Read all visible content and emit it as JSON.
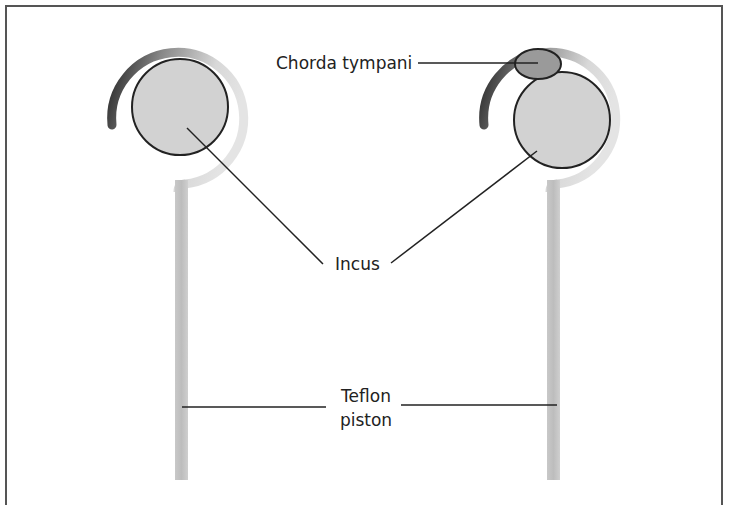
{
  "figure": {
    "labels": {
      "chorda_tympani": "Chorda tympani",
      "incus": "Incus",
      "teflon_line1": "Teflon",
      "teflon_line2": "piston"
    },
    "colors": {
      "frame": "#555555",
      "incus_fill": "#d2d2d2",
      "chorda_fill": "#9a9a9a",
      "piston_fill": "#c4c4c4",
      "leader_line": "#222222"
    }
  }
}
